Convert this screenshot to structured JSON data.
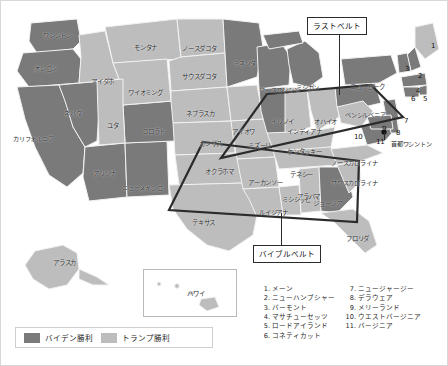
{
  "figure": {
    "title_callouts": [
      {
        "name": "rust-belt",
        "label": "ラストベルト"
      },
      {
        "name": "bible-belt",
        "label": "バイブルベルト"
      }
    ]
  },
  "colors": {
    "biden": "#7a7a7a",
    "trump": "#bdbdbd",
    "water": "#ffffff",
    "border": "#f2f2f2",
    "outline": "#2b2b2b",
    "text": "#1f1f1f"
  },
  "legend": {
    "items": [
      {
        "name": "legend-biden",
        "label": "バイデン勝利",
        "color": "#7a7a7a"
      },
      {
        "name": "legend-trump",
        "label": "トランプ勝利",
        "color": "#bdbdbd"
      }
    ]
  },
  "state_labels": [
    {
      "text": "ワシントン",
      "x": 42,
      "y": 32
    },
    {
      "text": "オレゴン",
      "x": 33,
      "y": 65
    },
    {
      "text": "カリフォルニア",
      "x": 12,
      "y": 135
    },
    {
      "text": "ネバダ",
      "x": 63,
      "y": 110
    },
    {
      "text": "アイダホ",
      "x": 90,
      "y": 78
    },
    {
      "text": "モンタナ",
      "x": 133,
      "y": 44
    },
    {
      "text": "ワイオミング",
      "x": 127,
      "y": 89
    },
    {
      "text": "ユタ",
      "x": 106,
      "y": 122
    },
    {
      "text": "アリゾナ",
      "x": 92,
      "y": 170
    },
    {
      "text": "コロラド",
      "x": 141,
      "y": 128
    },
    {
      "text": "ニューメキシコ",
      "x": 121,
      "y": 184
    },
    {
      "text": "ノースダコタ",
      "x": 181,
      "y": 45
    },
    {
      "text": "サウスダコタ",
      "x": 181,
      "y": 73
    },
    {
      "text": "ネブラスカ",
      "x": 185,
      "y": 110
    },
    {
      "text": "カンザス",
      "x": 198,
      "y": 140
    },
    {
      "text": "オクラホマ",
      "x": 204,
      "y": 168
    },
    {
      "text": "テキサス",
      "x": 191,
      "y": 219
    },
    {
      "text": "ミネソタ",
      "x": 232,
      "y": 60
    },
    {
      "text": "アイオワ",
      "x": 231,
      "y": 128
    },
    {
      "text": "ミズーリ",
      "x": 247,
      "y": 142
    },
    {
      "text": "アーカンソー",
      "x": 247,
      "y": 179
    },
    {
      "text": "ルイジアナ",
      "x": 258,
      "y": 209
    },
    {
      "text": "ミシシッピ",
      "x": 281,
      "y": 196
    },
    {
      "text": "ウィスコンシン",
      "x": 258,
      "y": 86
    },
    {
      "text": "イリノイ",
      "x": 270,
      "y": 118
    },
    {
      "text": "インディアナ",
      "x": 286,
      "y": 128
    },
    {
      "text": "ミシガン",
      "x": 295,
      "y": 84
    },
    {
      "text": "オハイオ",
      "x": 313,
      "y": 118
    },
    {
      "text": "ケンタッキー",
      "x": 286,
      "y": 148
    },
    {
      "text": "テネシー",
      "x": 289,
      "y": 171
    },
    {
      "text": "アラバマ",
      "x": 296,
      "y": 193
    },
    {
      "text": "ジョージア",
      "x": 312,
      "y": 200
    },
    {
      "text": "フロリダ",
      "x": 345,
      "y": 235
    },
    {
      "text": "サウスカロライナ",
      "x": 330,
      "y": 179
    },
    {
      "text": "ノースカロライナ",
      "x": 330,
      "y": 159
    },
    {
      "text": "ニューヨーク",
      "x": 349,
      "y": 83
    },
    {
      "text": "ペンシルベニア",
      "x": 344,
      "y": 111
    },
    {
      "text": "首都ワシントン",
      "x": 390,
      "y": 140
    },
    {
      "text": "アラスカ",
      "x": 52,
      "y": 259
    },
    {
      "text": "ハワイ",
      "x": 186,
      "y": 290
    }
  ],
  "numbered_markers": [
    {
      "n": "1",
      "x": 430,
      "y": 42
    },
    {
      "n": "2",
      "x": 417,
      "y": 72
    },
    {
      "n": "3",
      "x": 404,
      "y": 65
    },
    {
      "n": "4",
      "x": 415,
      "y": 87
    },
    {
      "n": "5",
      "x": 422,
      "y": 95
    },
    {
      "n": "6",
      "x": 410,
      "y": 95
    },
    {
      "n": "7",
      "x": 403,
      "y": 117
    },
    {
      "n": "8",
      "x": 395,
      "y": 129
    },
    {
      "n": "9",
      "x": 381,
      "y": 125
    },
    {
      "n": "10",
      "x": 353,
      "y": 133
    },
    {
      "n": "11",
      "x": 375,
      "y": 138
    }
  ],
  "state_list": {
    "left": [
      {
        "n": "1.",
        "label": "メーン"
      },
      {
        "n": "2.",
        "label": "ニューハンプシャー"
      },
      {
        "n": "3.",
        "label": "バーモント"
      },
      {
        "n": "4.",
        "label": "マサチューセッツ"
      },
      {
        "n": "5.",
        "label": "ロードアイランド"
      },
      {
        "n": "6.",
        "label": "コネティカット"
      }
    ],
    "right": [
      {
        "n": "7.",
        "label": "ニュージャージー"
      },
      {
        "n": "8.",
        "label": "デラウェア"
      },
      {
        "n": "9.",
        "label": "メリーランド"
      },
      {
        "n": "10.",
        "label": "ウエストバージニア"
      },
      {
        "n": "11.",
        "label": "バージニア"
      }
    ]
  },
  "chart_data": {
    "type": "map",
    "categories": [
      "バイデン勝利",
      "トランプ勝利"
    ],
    "annotations": [
      "ラストベルト",
      "バイブルベルト"
    ],
    "regions": [
      {
        "state": "ワシントン",
        "winner": "バイデン勝利"
      },
      {
        "state": "オレゴン",
        "winner": "バイデン勝利"
      },
      {
        "state": "カリフォルニア",
        "winner": "バイデン勝利"
      },
      {
        "state": "ネバダ",
        "winner": "バイデン勝利"
      },
      {
        "state": "アリゾナ",
        "winner": "バイデン勝利"
      },
      {
        "state": "ニューメキシコ",
        "winner": "バイデン勝利"
      },
      {
        "state": "コロラド",
        "winner": "バイデン勝利"
      },
      {
        "state": "ミネソタ",
        "winner": "バイデン勝利"
      },
      {
        "state": "ウィスコンシン",
        "winner": "バイデン勝利"
      },
      {
        "state": "ミシガン",
        "winner": "バイデン勝利"
      },
      {
        "state": "イリノイ",
        "winner": "バイデン勝利"
      },
      {
        "state": "ペンシルベニア",
        "winner": "バイデン勝利"
      },
      {
        "state": "ニューヨーク",
        "winner": "バイデン勝利"
      },
      {
        "state": "ジョージア",
        "winner": "バイデン勝利"
      },
      {
        "state": "バージニア",
        "winner": "バイデン勝利"
      },
      {
        "state": "アイダホ",
        "winner": "トランプ勝利"
      },
      {
        "state": "モンタナ",
        "winner": "トランプ勝利"
      },
      {
        "state": "ワイオミング",
        "winner": "トランプ勝利"
      },
      {
        "state": "ユタ",
        "winner": "トランプ勝利"
      },
      {
        "state": "ノースダコタ",
        "winner": "トランプ勝利"
      },
      {
        "state": "サウスダコタ",
        "winner": "トランプ勝利"
      },
      {
        "state": "ネブラスカ",
        "winner": "トランプ勝利"
      },
      {
        "state": "カンザス",
        "winner": "トランプ勝利"
      },
      {
        "state": "オクラホマ",
        "winner": "トランプ勝利"
      },
      {
        "state": "テキサス",
        "winner": "トランプ勝利"
      },
      {
        "state": "アイオワ",
        "winner": "トランプ勝利"
      },
      {
        "state": "ミズーリ",
        "winner": "トランプ勝利"
      },
      {
        "state": "アーカンソー",
        "winner": "トランプ勝利"
      },
      {
        "state": "ルイジアナ",
        "winner": "トランプ勝利"
      },
      {
        "state": "ミシシッピ",
        "winner": "トランプ勝利"
      },
      {
        "state": "アラバマ",
        "winner": "トランプ勝利"
      },
      {
        "state": "テネシー",
        "winner": "トランプ勝利"
      },
      {
        "state": "ケンタッキー",
        "winner": "トランプ勝利"
      },
      {
        "state": "インディアナ",
        "winner": "トランプ勝利"
      },
      {
        "state": "オハイオ",
        "winner": "トランプ勝利"
      },
      {
        "state": "フロリダ",
        "winner": "トランプ勝利"
      },
      {
        "state": "ノースカロライナ",
        "winner": "トランプ勝利"
      },
      {
        "state": "サウスカロライナ",
        "winner": "トランプ勝利"
      },
      {
        "state": "アラスカ",
        "winner": "トランプ勝利"
      },
      {
        "state": "ハワイ",
        "winner": "バイデン勝利"
      }
    ]
  }
}
